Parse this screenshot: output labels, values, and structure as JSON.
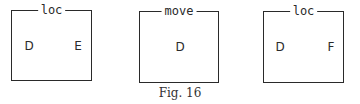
{
  "figure": {
    "caption": "Fig. 16",
    "boxes": [
      {
        "title": "loc",
        "left_label": "D",
        "right_label": "E"
      },
      {
        "title": "move",
        "center_label": "D"
      },
      {
        "title": "loc",
        "left_label": "D",
        "right_label": "F"
      }
    ]
  },
  "colors": {
    "stroke": "#2a2a2a",
    "background": "#ffffff"
  }
}
